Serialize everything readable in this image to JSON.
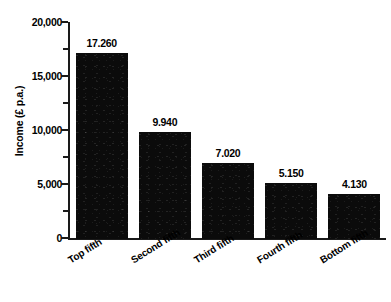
{
  "chart_data": {
    "type": "bar",
    "title": "",
    "subtitle": "",
    "xlabel": "",
    "ylabel": "Income (£ p.a.)",
    "categories": [
      "Top fifth",
      "Second fifth",
      "Third fifth",
      "Fourth fifth",
      "Bottom fifth"
    ],
    "values": [
      17260,
      9940,
      7020,
      5150,
      4130
    ],
    "value_labels": [
      "17.260",
      "9.940",
      "7.020",
      "5.150",
      "4.130"
    ],
    "ylim": [
      0,
      20000
    ],
    "y_major_ticks": [
      0,
      5000,
      10000,
      15000,
      20000
    ],
    "y_tick_labels": [
      "0",
      "5,000",
      "10,000",
      "15,000",
      "20,000"
    ],
    "y_minor_ticks": [
      2500,
      7500,
      12500,
      17500
    ],
    "grid": false,
    "legend": null,
    "bar_color": "#0b0b0b",
    "background_color": "#ffffff",
    "axis_color": "#1a1a1a"
  },
  "axis": {
    "y_title": "Income (£ p.a.)"
  }
}
